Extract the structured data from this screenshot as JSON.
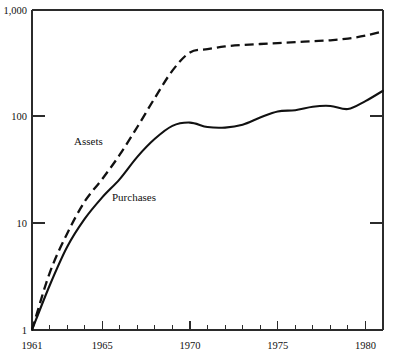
{
  "chart_data": {
    "type": "line",
    "title": "",
    "subtitle": "",
    "xlabel": "",
    "ylabel": "",
    "yscale": "log",
    "ylim": [
      1,
      1000
    ],
    "xlim": [
      1961,
      1981
    ],
    "grid": false,
    "legend_position": "inline-annotation",
    "y_ticks": [
      1,
      10,
      100,
      1000
    ],
    "y_tick_labels": [
      "1",
      "10",
      "100",
      "1,000"
    ],
    "x_ticks": [
      1961,
      1962,
      1963,
      1964,
      1965,
      1966,
      1967,
      1968,
      1969,
      1970,
      1971,
      1972,
      1973,
      1974,
      1975,
      1976,
      1977,
      1978,
      1979,
      1980,
      1981
    ],
    "x_tick_labels_shown": [
      {
        "year": 1961,
        "label": "1961"
      },
      {
        "year": 1965,
        "label": "1965"
      },
      {
        "year": 1970,
        "label": "1970"
      },
      {
        "year": 1975,
        "label": "1975"
      },
      {
        "year": 1980,
        "label": "1980"
      }
    ],
    "x": [
      1961,
      1962,
      1963,
      1964,
      1965,
      1966,
      1967,
      1968,
      1969,
      1970,
      1971,
      1972,
      1973,
      1974,
      1975,
      1976,
      1977,
      1978,
      1979,
      1980,
      1981
    ],
    "series": [
      {
        "name": "Assets",
        "style": "dashed",
        "color": "#111111",
        "label": "Assets",
        "values": [
          1.0,
          3.4,
          8.0,
          16.0,
          26.0,
          44.0,
          80.0,
          150.0,
          270.0,
          400.0,
          430.0,
          455.0,
          470.0,
          480.0,
          490.0,
          500.0,
          510.0,
          520.0,
          540.0,
          575.0,
          630.0
        ]
      },
      {
        "name": "Purchases",
        "style": "solid",
        "color": "#111111",
        "label": "Purchases",
        "values": [
          1.0,
          2.6,
          6.0,
          11.0,
          17.5,
          26.0,
          42.0,
          62.0,
          82.0,
          88.0,
          80.0,
          79.0,
          84.0,
          98.0,
          112.0,
          115.0,
          124.0,
          126.0,
          118.0,
          140.0,
          175.0
        ]
      }
    ],
    "annotations": [
      {
        "text": "Assets",
        "x_px": 74,
        "y_px": 145
      },
      {
        "text": "Purchases",
        "x_px": 112,
        "y_px": 201
      }
    ]
  },
  "axes": {
    "y_label_1000": "1,000",
    "y_label_100": "100",
    "y_label_10": "10",
    "y_label_1": "1",
    "x_label_1961": "1961",
    "x_label_1965": "1965",
    "x_label_1970": "1970",
    "x_label_1975": "1975",
    "x_label_1980": "1980"
  },
  "colors": {
    "line": "#111111",
    "frame": "#2b2b2b",
    "background": "#ffffff"
  }
}
